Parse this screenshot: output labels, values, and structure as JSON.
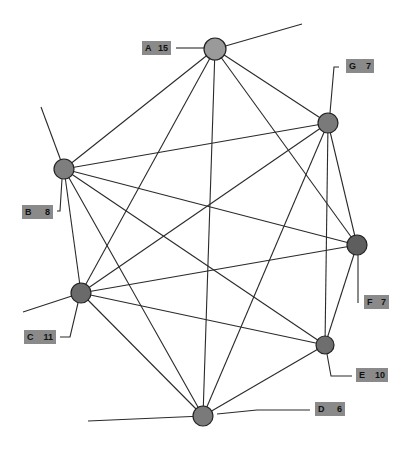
{
  "diagram": {
    "type": "network-graph",
    "nodes": [
      {
        "id": "A",
        "value": "15",
        "x": 215,
        "y": 49,
        "r": 11,
        "fill": "#9a9a9a"
      },
      {
        "id": "G",
        "value": "7",
        "x": 328,
        "y": 123,
        "r": 10,
        "fill": "#7a7a7a"
      },
      {
        "id": "B",
        "value": "8",
        "x": 64,
        "y": 169,
        "r": 10,
        "fill": "#7e7e7e"
      },
      {
        "id": "F",
        "value": "7",
        "x": 357,
        "y": 245,
        "r": 10,
        "fill": "#5e5e5e"
      },
      {
        "id": "C",
        "value": "11",
        "x": 81,
        "y": 293,
        "r": 10,
        "fill": "#6a6a6a"
      },
      {
        "id": "E",
        "value": "10",
        "x": 325,
        "y": 345,
        "r": 9,
        "fill": "#6e6e6e"
      },
      {
        "id": "D",
        "value": "6",
        "x": 203,
        "y": 416,
        "r": 10,
        "fill": "#7a7a7a"
      }
    ],
    "edges": [
      [
        "A",
        "B"
      ],
      [
        "A",
        "C"
      ],
      [
        "A",
        "D"
      ],
      [
        "A",
        "F"
      ],
      [
        "A",
        "G"
      ],
      [
        "B",
        "G"
      ],
      [
        "B",
        "C"
      ],
      [
        "B",
        "D"
      ],
      [
        "B",
        "E"
      ],
      [
        "B",
        "F"
      ],
      [
        "G",
        "C"
      ],
      [
        "G",
        "D"
      ],
      [
        "G",
        "E"
      ],
      [
        "G",
        "F"
      ],
      [
        "C",
        "F"
      ],
      [
        "C",
        "E"
      ],
      [
        "C",
        "D"
      ],
      [
        "F",
        "E"
      ],
      [
        "E",
        "D"
      ]
    ],
    "stubs": [
      {
        "from": "A",
        "x2": 302,
        "y2": 24
      },
      {
        "from": "B",
        "x2": 41,
        "y2": 107
      },
      {
        "from": "C",
        "x2": 23,
        "y2": 312
      },
      {
        "from": "D",
        "x2": 88,
        "y2": 421
      }
    ],
    "labels": [
      {
        "node": "A",
        "letter": "A",
        "value": "15",
        "x": 142,
        "y": 41,
        "w": 29,
        "leader": "M176,48 L204,48"
      },
      {
        "node": "G",
        "letter": "G",
        "value": "7",
        "x": 346,
        "y": 59,
        "w": 28,
        "leader": "M339,67 L334,67 L330,113"
      },
      {
        "node": "B",
        "letter": "B",
        "value": "8",
        "x": 22,
        "y": 205,
        "w": 31,
        "leader": "M57,211 L60,211 L62,179"
      },
      {
        "node": "F",
        "letter": "F",
        "value": "7",
        "x": 364,
        "y": 295,
        "w": 25,
        "leader": "M358,303 L358,255"
      },
      {
        "node": "C",
        "letter": "C",
        "value": "11",
        "x": 24,
        "y": 330,
        "w": 32,
        "leader": "M60,337 L70,337 L78,303"
      },
      {
        "node": "E",
        "letter": "E",
        "value": "10",
        "x": 356,
        "y": 368,
        "w": 32,
        "leader": "M352,376 L331,376 L327,354"
      },
      {
        "node": "D",
        "letter": "D",
        "value": "6",
        "x": 315,
        "y": 402,
        "w": 30,
        "leader": "M310,410 L257,410 L217,414"
      }
    ]
  }
}
